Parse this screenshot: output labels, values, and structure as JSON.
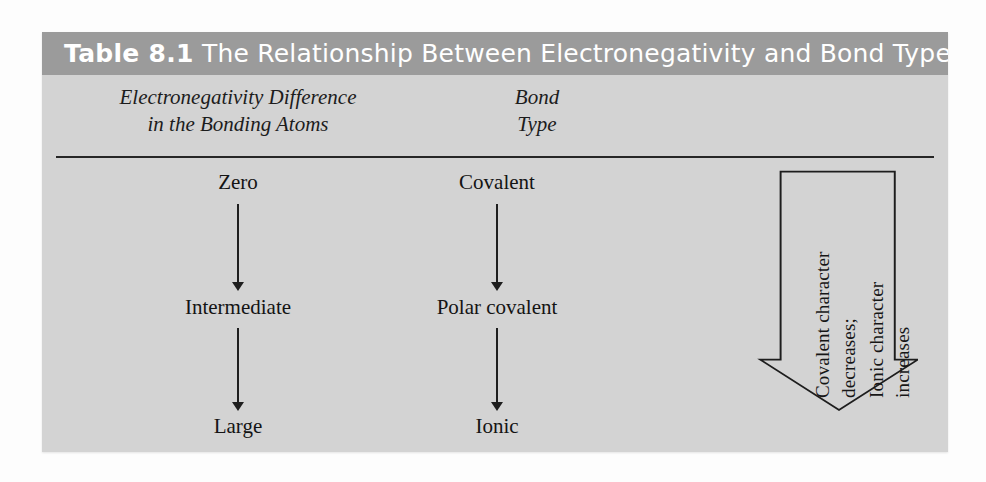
{
  "title": {
    "label": "Table 8.1",
    "text": "The Relationship Between Electronegativity and Bond Type",
    "full": "Table 8.1 The Relationship Between Electronegativity and Bond Type"
  },
  "colors": {
    "title_bar": "#9b9b9b",
    "panel": "#d3d3d3",
    "rule": "#262626",
    "text": "#141414",
    "title_text": "#ffffff",
    "page": "#fdfdfd"
  },
  "columns": [
    {
      "line1": "Electronegativity Difference",
      "line2": "in the Bonding Atoms"
    },
    {
      "line1": "Bond",
      "line2": "Type"
    }
  ],
  "rows": [
    {
      "electronegativity_difference": "Zero",
      "bond_type": "Covalent"
    },
    {
      "electronegativity_difference": "Intermediate",
      "bond_type": "Polar covalent"
    },
    {
      "electronegativity_difference": "Large",
      "bond_type": "Ionic"
    }
  ],
  "block_arrow": {
    "direction": "down",
    "lines": [
      "Covalent character",
      "decreases;",
      "Ionic character",
      "increases"
    ]
  }
}
